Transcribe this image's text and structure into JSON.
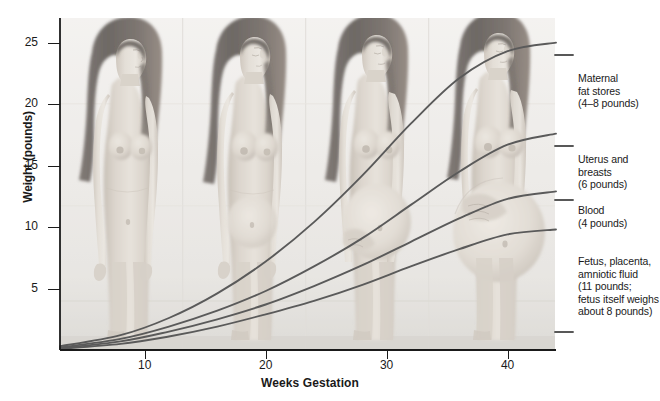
{
  "figure": {
    "title": "",
    "background_color": "#ffffff",
    "illustration": {
      "name": "pregnancy-stages-illustration",
      "description": "Four grayscale figures of the same woman shown at progressive stages of pregnancy, left to right",
      "figure_count": 4,
      "palette": {
        "skin_light": "#d9d3cb",
        "skin_mid": "#c2b9ae",
        "skin_shadow": "#a79c8f",
        "hair_dark": "#3b332d",
        "hair_mid": "#5d5148",
        "backdrop": "#e8e6e2"
      }
    }
  },
  "axes": {
    "y_label": "Weight (pounds)",
    "x_label": "Weeks Gestation",
    "y_ticks": [
      "5",
      "10",
      "15",
      "20",
      "25"
    ],
    "x_ticks": [
      "10",
      "20",
      "30",
      "40"
    ],
    "axis_color": "#1a1a1a"
  },
  "annotations": [
    {
      "name": "maternal-fat-stores",
      "lines": [
        "Maternal",
        "fat stores",
        "(4–8 pounds)"
      ],
      "top": 72
    },
    {
      "name": "uterus-and-breasts",
      "lines": [
        "Uterus and",
        "breasts",
        "(6 pounds)"
      ],
      "top": 153
    },
    {
      "name": "blood",
      "lines": [
        "Blood",
        "(4 pounds)"
      ],
      "top": 204
    },
    {
      "name": "fetus-placenta-amniotic-fluid",
      "lines": [
        "Fetus, placenta,",
        "amniotic fluid",
        "(11 pounds;",
        "fetus itself weighs",
        "about 8 pounds)"
      ],
      "top": 255
    }
  ],
  "chart_data": {
    "type": "line",
    "title": "",
    "xlabel": "Weeks Gestation",
    "ylabel": "Weight (pounds)",
    "xlim": [
      3,
      44
    ],
    "ylim": [
      0,
      27
    ],
    "xticks": [
      10,
      20,
      30,
      40
    ],
    "yticks": [
      5,
      10,
      15,
      20,
      25
    ],
    "grid": false,
    "legend": "right-side annotations",
    "note": "Cumulative-style curves of the components of weight gain during pregnancy; each curve is the weight contributed by one component across gestation.",
    "series": [
      {
        "name": "Maternal fat stores (4–8 pounds)",
        "color": "#5a5a5a",
        "final_value": 25,
        "x": [
          3,
          8,
          12,
          16,
          20,
          24,
          28,
          32,
          36,
          40,
          44
        ],
        "y": [
          0.3,
          1.2,
          2.6,
          4.6,
          7.2,
          10.4,
          14.2,
          18.4,
          22.1,
          24.3,
          25.0
        ]
      },
      {
        "name": "Uterus and breasts (6 pounds)",
        "color": "#5a5a5a",
        "final_value": 17.6,
        "x": [
          3,
          8,
          12,
          16,
          20,
          24,
          28,
          32,
          36,
          40,
          44
        ],
        "y": [
          0.2,
          0.9,
          1.9,
          3.2,
          4.8,
          6.8,
          9.1,
          11.8,
          14.5,
          16.7,
          17.6
        ]
      },
      {
        "name": "Blood (4 pounds)",
        "color": "#5a5a5a",
        "final_value": 12.9,
        "x": [
          3,
          8,
          12,
          16,
          20,
          24,
          28,
          32,
          36,
          40,
          44
        ],
        "y": [
          0.15,
          0.7,
          1.5,
          2.5,
          3.7,
          5.2,
          6.9,
          8.8,
          10.7,
          12.3,
          12.9
        ]
      },
      {
        "name": "Fetus, placenta, amniotic fluid (11 pounds; fetus itself weighs about 8 pounds)",
        "color": "#5a5a5a",
        "final_value": 9.8,
        "x": [
          3,
          8,
          12,
          16,
          20,
          24,
          28,
          32,
          36,
          40,
          44
        ],
        "y": [
          0.1,
          0.5,
          1.1,
          1.9,
          2.9,
          4.0,
          5.3,
          6.8,
          8.2,
          9.4,
          9.8
        ]
      }
    ]
  }
}
